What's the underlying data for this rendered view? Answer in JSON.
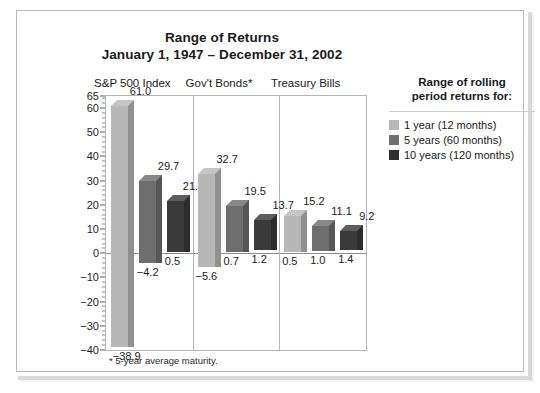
{
  "chart_data": {
    "type": "bar",
    "title": "Range of Returns",
    "subtitle": "January 1, 1947 – December 31, 2002",
    "xlabel": "",
    "ylabel": "",
    "ylim": [
      -40,
      65
    ],
    "yticks": [
      65,
      60,
      50,
      40,
      30,
      20,
      10,
      0,
      -10,
      -20,
      -30,
      -40
    ],
    "ytick_labels": [
      "65",
      "60",
      "50",
      "40",
      "30",
      "20",
      "10",
      "0",
      "−10",
      "−20",
      "−30",
      "−40"
    ],
    "grid": false,
    "legend_position": "right",
    "categories": [
      "S&P 500 Index",
      "Gov't Bonds*",
      "Treasury Bills"
    ],
    "series": [
      {
        "name": "1 year (12 months)",
        "color": "#b8b8b8",
        "high": [
          61.0,
          32.7,
          15.2
        ],
        "low": [
          -38.9,
          -5.6,
          0.5
        ],
        "high_labels": [
          "61.0",
          "32.7",
          "15.2"
        ],
        "low_labels": [
          "−38.9",
          "−5.6",
          "0.5"
        ]
      },
      {
        "name": "5 years (60 months)",
        "color": "#6e6e6e",
        "high": [
          29.7,
          19.5,
          11.1
        ],
        "low": [
          -4.2,
          0.7,
          1.0
        ],
        "high_labels": [
          "29.7",
          "19.5",
          "11.1"
        ],
        "low_labels": [
          "−4.2",
          "0.7",
          "1.0"
        ]
      },
      {
        "name": "10 years (120 months)",
        "color": "#3a3a3a",
        "high": [
          21.4,
          13.7,
          9.2
        ],
        "low": [
          0.5,
          1.2,
          1.4
        ],
        "high_labels": [
          "21.4",
          "13.7",
          "9.2"
        ],
        "low_labels": [
          "0.5",
          "1.2",
          "1.4"
        ]
      }
    ],
    "footnote": "* 5-year average maturity."
  },
  "legend": {
    "title_line1": "Range of rolling",
    "title_line2": "period returns for:",
    "items": [
      {
        "label": "1 year (12 months)",
        "color": "#b8b8b8"
      },
      {
        "label": "5 years (60 months)",
        "color": "#6e6e6e"
      },
      {
        "label": "10 years (120 months)",
        "color": "#2e2e2e"
      }
    ]
  }
}
